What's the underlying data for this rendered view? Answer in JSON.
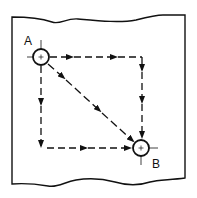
{
  "diagram": {
    "title": "",
    "points": {
      "start": {
        "label": "A",
        "cx": 41,
        "cy": 57,
        "r": 8
      },
      "end": {
        "label": "B",
        "cx": 141,
        "cy": 148,
        "r": 8
      }
    },
    "paths": [
      {
        "name": "top-then-right",
        "description": "A → right along top → down to B"
      },
      {
        "name": "diagonal",
        "description": "A → straight diagonal → B"
      },
      {
        "name": "left-then-bottom",
        "description": "A → down left side → right along bottom to B"
      }
    ],
    "colors": {
      "ink": "#111111",
      "paper": "#ffffff"
    }
  }
}
